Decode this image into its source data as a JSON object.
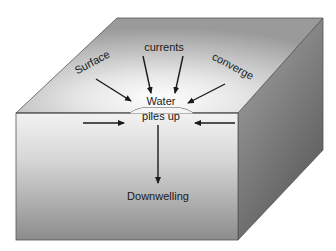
{
  "diagram": {
    "type": "ocean-block-cross-section",
    "labels": {
      "surface": "Surface",
      "currents": "currents",
      "converge": "converge",
      "water": "Water",
      "piles_up": "piles up",
      "downwelling": "Downwelling"
    },
    "colors": {
      "top_face_light": "#f2f2f2",
      "top_face_dark": "#9a9a9a",
      "front_face_light": "#ececec",
      "front_face_dark": "#8a8a8a",
      "right_face_light": "#9c9c9c",
      "right_face_dark": "#5c5c5c",
      "edge": "#555555",
      "arrow": "#1a1a1a",
      "text": "#1a1a1a"
    }
  }
}
